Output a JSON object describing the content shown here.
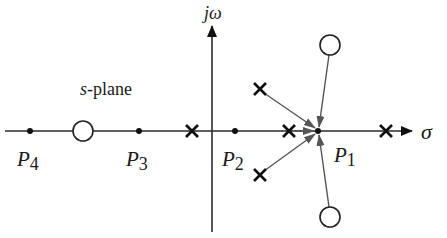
{
  "diagram": {
    "plane_label": "s-plane",
    "plane_label_var": "s",
    "plane_label_rest": "-plane",
    "axes": {
      "horizontal_label": "σ",
      "vertical_label": "jω"
    },
    "points": [
      {
        "id": "P1",
        "letter": "P",
        "sub": "1",
        "x": 318,
        "y": 131
      },
      {
        "id": "P2",
        "letter": "P",
        "sub": "2",
        "x": 235,
        "y": 131
      },
      {
        "id": "P3",
        "letter": "P",
        "sub": "3",
        "x": 139,
        "y": 131
      },
      {
        "id": "P4",
        "letter": "P",
        "sub": "4",
        "x": 30,
        "y": 131
      }
    ],
    "poles": [
      {
        "x": 192,
        "y": 131
      },
      {
        "x": 289,
        "y": 131
      },
      {
        "x": 386,
        "y": 131
      },
      {
        "x": 260,
        "y": 89
      },
      {
        "x": 260,
        "y": 175
      }
    ],
    "zeros": [
      {
        "x": 83,
        "y": 131
      },
      {
        "x": 330,
        "y": 45
      },
      {
        "x": 330,
        "y": 217
      }
    ],
    "colors": {
      "axis": "#2a2a2a",
      "vector": "#555555",
      "marker": "#111111"
    }
  }
}
